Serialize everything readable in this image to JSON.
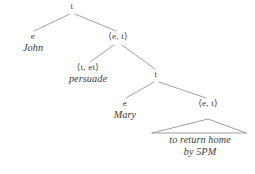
{
  "figure": {
    "kind": "semantic-type-tree",
    "stroke_color": "#8a8a8a",
    "text_color": "#3c3c3c",
    "background": "#ffffff"
  },
  "nodes": {
    "root": {
      "type": "t"
    },
    "john": {
      "type": "e",
      "word": "John"
    },
    "et_upper": {
      "type": "⟨e, t⟩"
    },
    "persuade": {
      "type": "⟨t, et⟩",
      "word": "persuade"
    },
    "t_inner": {
      "type": "t"
    },
    "mary": {
      "type": "e",
      "word": "Mary"
    },
    "et_lower": {
      "type": "⟨e, t⟩"
    },
    "phrase": {
      "line1": "to return home",
      "line2": "by 5PM"
    }
  }
}
